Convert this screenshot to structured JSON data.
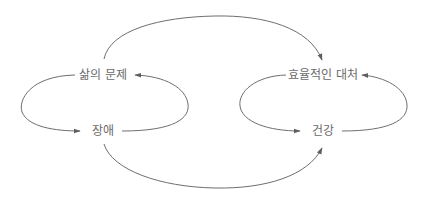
{
  "diagram": {
    "type": "causal-loop",
    "colors": {
      "background": "#ffffff",
      "edge": "#6e6e6e",
      "label": "#6a6a6a"
    },
    "nodes": [
      {
        "id": "life_problems",
        "label": "삶의 문제",
        "x": 103,
        "y": 75
      },
      {
        "id": "disability",
        "label": "장애",
        "x": 103,
        "y": 131
      },
      {
        "id": "effective_coping",
        "label": "효율적인 대처",
        "x": 323,
        "y": 75
      },
      {
        "id": "health",
        "label": "건강",
        "x": 323,
        "y": 131
      }
    ],
    "edges": [
      {
        "from": "life_problems",
        "to": "disability",
        "shape": "left-loop"
      },
      {
        "from": "disability",
        "to": "life_problems",
        "shape": "right-loop"
      },
      {
        "from": "effective_coping",
        "to": "health",
        "shape": "left-loop"
      },
      {
        "from": "health",
        "to": "effective_coping",
        "shape": "right-loop"
      },
      {
        "from": "life_problems",
        "to": "effective_coping",
        "shape": "top-arc"
      },
      {
        "from": "disability",
        "to": "health",
        "shape": "bottom-arc"
      }
    ]
  }
}
